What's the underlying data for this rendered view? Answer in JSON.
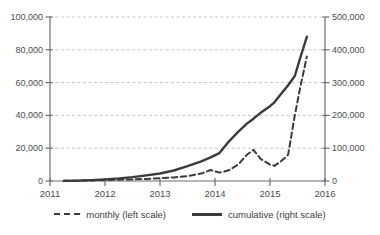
{
  "chart_data": {
    "type": "line",
    "title": "",
    "grid": "horizontal-dashed",
    "legend_position": "bottom",
    "x_axis": {
      "min": 2011,
      "max": 2016,
      "tick_values": [
        2011,
        2012,
        2013,
        2014,
        2015,
        2016
      ],
      "tick_labels": [
        "2011",
        "2012",
        "2013",
        "2014",
        "2015",
        "2016"
      ]
    },
    "y_axis_left": {
      "min": 0,
      "max": 100000,
      "tick_values": [
        0,
        20000,
        40000,
        60000,
        80000,
        100000
      ],
      "tick_labels": [
        "0",
        "20,000",
        "40,000",
        "60,000",
        "80,000",
        "100,000"
      ]
    },
    "y_axis_right": {
      "min": 0,
      "max": 500000,
      "tick_values": [
        0,
        100000,
        200000,
        300000,
        400000,
        500000
      ],
      "tick_labels": [
        "0",
        "100,000",
        "200,000",
        "300,000",
        "400,000",
        "500,000"
      ]
    },
    "x": [
      2011.25,
      2011.5,
      2011.75,
      2012.0,
      2012.25,
      2012.5,
      2012.75,
      2013.0,
      2013.25,
      2013.5,
      2013.75,
      2013.92,
      2014.08,
      2014.25,
      2014.42,
      2014.58,
      2014.7,
      2014.83,
      2015.0,
      2015.08,
      2015.2,
      2015.33,
      2015.45,
      2015.55,
      2015.67
    ],
    "series": [
      {
        "name": "monthly (left scale)",
        "axis": "left",
        "line_style": "dashed",
        "color": "#3b3b3b",
        "values": [
          100,
          200,
          350,
          600,
          800,
          1000,
          1300,
          1700,
          2200,
          3000,
          4500,
          6700,
          5100,
          6500,
          10000,
          16000,
          19000,
          13500,
          10000,
          9200,
          12000,
          16000,
          40000,
          57000,
          76000
        ]
      },
      {
        "name": "cumulative (right scale)",
        "axis": "right",
        "line_style": "solid",
        "color": "#3b3b3b",
        "values": [
          300,
          1200,
          2800,
          5000,
          8000,
          12000,
          17000,
          23000,
          32000,
          45000,
          60000,
          72000,
          85000,
          120000,
          150000,
          175000,
          190000,
          208000,
          228000,
          240000,
          265000,
          292000,
          320000,
          375000,
          440000
        ]
      }
    ],
    "colors": {
      "line": "#3b3b3b",
      "gridline": "#c6c6c6",
      "axis": "#6e6e6e",
      "tick_text": "#4d4d4d"
    }
  }
}
